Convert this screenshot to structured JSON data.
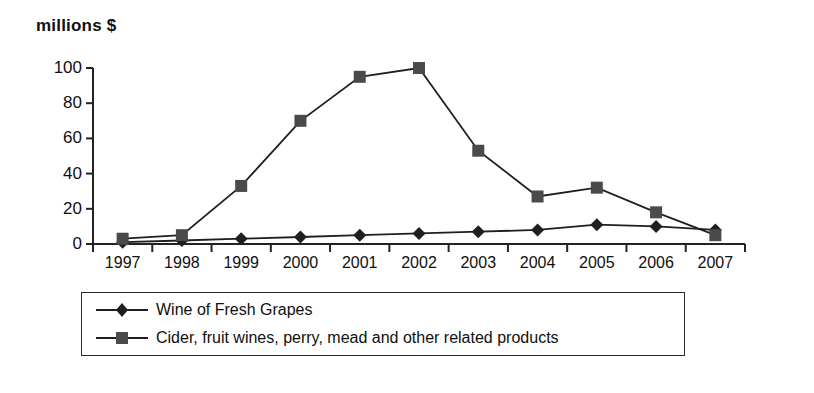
{
  "chart_data": {
    "type": "line",
    "title": "millions $",
    "xlabel": "",
    "ylabel": "millions $",
    "categories": [
      "1997",
      "1998",
      "1999",
      "2000",
      "2001",
      "2002",
      "2003",
      "2004",
      "2005",
      "2006",
      "2007"
    ],
    "yticks": [
      "0",
      "20",
      "40",
      "60",
      "80",
      "100"
    ],
    "ylim": [
      0,
      100
    ],
    "grid": false,
    "legend_position": "bottom",
    "series": [
      {
        "name": "Wine of Fresh Grapes",
        "marker": "diamond",
        "color": "#1f1f1f",
        "values": [
          1,
          2,
          3,
          4,
          5,
          6,
          7,
          8,
          11,
          10,
          8
        ]
      },
      {
        "name": "Cider, fruit wines, perry, mead and other related products",
        "marker": "square",
        "color": "#4a4a4a",
        "values": [
          3,
          5,
          33,
          70,
          95,
          100,
          53,
          27,
          32,
          18,
          5
        ]
      }
    ]
  },
  "legend": {
    "items": [
      {
        "label": "Wine of Fresh Grapes",
        "marker": "diamond-marker-icon"
      },
      {
        "label": "Cider, fruit wines, perry, mead and other related products",
        "marker": "square-marker-icon"
      }
    ]
  }
}
